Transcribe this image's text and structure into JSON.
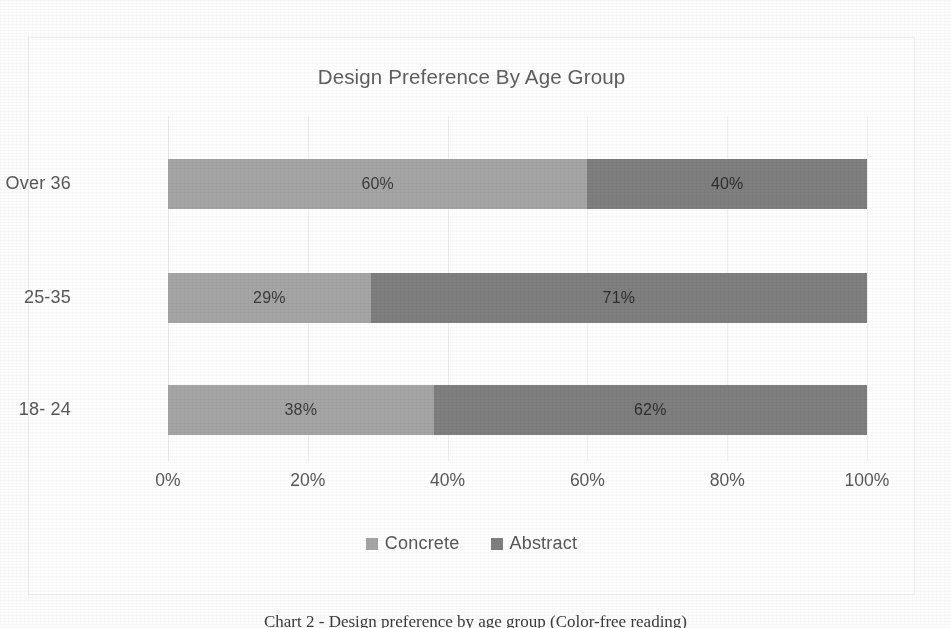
{
  "chart_data": {
    "type": "bar",
    "subtype": "stacked-horizontal-100pct",
    "title": "Design Preference By Age Group",
    "xlabel": "",
    "ylabel": "",
    "categories": [
      "Over 36",
      "25-35",
      "18- 24"
    ],
    "series": [
      {
        "name": "Concrete",
        "values": [
          60,
          29,
          38
        ],
        "color": "#a5a5a5"
      },
      {
        "name": "Abstract",
        "values": [
          40,
          71,
          62
        ],
        "color": "#7f7f7f"
      }
    ],
    "data_labels": [
      [
        "60%",
        "40%"
      ],
      [
        "29%",
        "71%"
      ],
      [
        "38%",
        "62%"
      ]
    ],
    "xticks": [
      0,
      20,
      40,
      60,
      80,
      100
    ],
    "xtick_labels": [
      "0%",
      "20%",
      "40%",
      "60%",
      "80%",
      "100%"
    ],
    "xlim": [
      0,
      100
    ],
    "grid": true,
    "grid_axis": "x",
    "legend_position": "bottom",
    "orientation": "horizontal"
  },
  "chart": {
    "title": "Design Preference By Age Group",
    "legend": [
      {
        "label": "Concrete",
        "color": "#a5a5a5"
      },
      {
        "label": "Abstract",
        "color": "#7f7f7f"
      }
    ]
  },
  "caption": {
    "text": "Chart 2 - Design preference by age group (Color-free reading)"
  },
  "colors": {
    "concrete": "#a5a5a5",
    "abstract": "#7f7f7f",
    "gridline": "#f0f0f0",
    "text": "#585858",
    "frame": "#efefef"
  }
}
